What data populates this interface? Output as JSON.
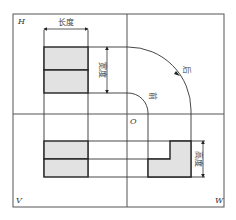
{
  "diagram": {
    "type": "three-view projection (orthographic)",
    "quadrant_labels": {
      "top_left": "H",
      "bottom_left": "V",
      "bottom_right": "W",
      "origin": "O"
    },
    "dimension_labels": {
      "length": "长度",
      "width": "宽度",
      "height": "高度"
    },
    "arc_labels": {
      "inner": "前",
      "outer": "后"
    },
    "colors": {
      "face_fill": "#e2e2e2",
      "stroke": "#222222",
      "frame": "#555555"
    }
  }
}
